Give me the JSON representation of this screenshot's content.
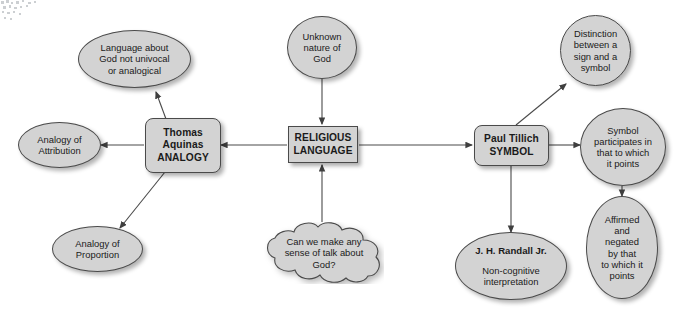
{
  "diagram": {
    "background_color": "#ffffff",
    "node_fill_color": "#d3d3d3",
    "node_border_color": "#4a4a4a",
    "text_color": "#1a1a1a",
    "edge_color": "#4a4a4a"
  },
  "nodes": {
    "language_about_god": {
      "label": "Language about\nGod not univocal\nor analogical",
      "shape": "ellipse"
    },
    "thomas_aquinas": {
      "label": "Thomas\nAquinas\nANALOGY",
      "shape": "rounded-rectangle"
    },
    "analogy_of_attribution": {
      "label": "Analogy of\nAttribution",
      "shape": "ellipse"
    },
    "analogy_of_proportion": {
      "label": "Analogy of\nProportion",
      "shape": "ellipse"
    },
    "unknown_nature_of_god": {
      "label": "Unknown\nnature of\nGod",
      "shape": "ellipse"
    },
    "religious_language": {
      "label": "RELIGIOUS\nLANGUAGE",
      "shape": "rectangle"
    },
    "can_we_make_sense": {
      "label": "Can we make any\nsense of talk about\nGod?",
      "shape": "cloud"
    },
    "paul_tillich": {
      "label": "Paul Tillich\nSYMBOL",
      "shape": "rounded-rectangle"
    },
    "distinction_sign_symbol": {
      "label": "Distinction\nbetween a\nsign and a\nsymbol",
      "shape": "ellipse"
    },
    "symbol_participates": {
      "label": "Symbol\nparticipates in\nthat to which\nit points",
      "shape": "ellipse"
    },
    "affirmed_and_negated": {
      "label": "Affirmed\nand\nnegated\nby that\nto which it\npoints",
      "shape": "ellipse"
    },
    "randall": {
      "title": "J. H. Randall Jr.",
      "subtitle": "Non-cognitive\ninterpretation",
      "shape": "ellipse"
    }
  },
  "edges": [
    {
      "from": "thomas_aquinas",
      "to": "language_about_god",
      "arrow": "to"
    },
    {
      "from": "thomas_aquinas",
      "to": "analogy_of_attribution",
      "arrow": "to"
    },
    {
      "from": "thomas_aquinas",
      "to": "analogy_of_proportion",
      "arrow": "to"
    },
    {
      "from": "religious_language",
      "to": "thomas_aquinas",
      "arrow": "to"
    },
    {
      "from": "unknown_nature_of_god",
      "to": "religious_language",
      "arrow": "to"
    },
    {
      "from": "can_we_make_sense",
      "to": "religious_language",
      "arrow": "to"
    },
    {
      "from": "religious_language",
      "to": "paul_tillich",
      "arrow": "to"
    },
    {
      "from": "paul_tillich",
      "to": "distinction_sign_symbol",
      "arrow": "to"
    },
    {
      "from": "paul_tillich",
      "to": "symbol_participates",
      "arrow": "to"
    },
    {
      "from": "paul_tillich",
      "to": "randall",
      "arrow": "to"
    },
    {
      "from": "symbol_participates",
      "to": "affirmed_and_negated",
      "arrow": "to"
    }
  ]
}
